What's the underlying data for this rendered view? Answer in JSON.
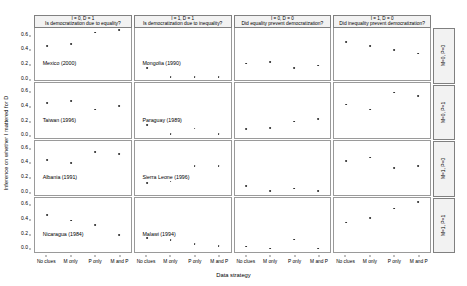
{
  "chart_data": {
    "type": "scatter",
    "title": "",
    "xlabel": "Data strategy",
    "ylabel": "Inference on whether I mattered for D",
    "categories": [
      "No clues",
      "M only",
      "P only",
      "M and P"
    ],
    "ylim": [
      -0.05,
      0.72
    ],
    "yticks": [
      0.0,
      0.2,
      0.4,
      0.6
    ],
    "ytick_labels": [
      "0.0",
      "0.2",
      "0.4",
      "0.6"
    ],
    "grid": false,
    "legend": "none",
    "col_strips": [
      {
        "condition": "I = 0, D = 1",
        "question": "Is democratization due to equality?"
      },
      {
        "condition": "I = 1, D = 1",
        "question": "Is democratization due to inequality?"
      },
      {
        "condition": "I = 0, D = 0",
        "question": "Did equality prevent democratization?"
      },
      {
        "condition": "I = 1, D = 0",
        "question": "Did inequality prevent democratization?"
      }
    ],
    "row_strips": [
      "M=0, P=0",
      "M=0, P=1",
      "M=1, P=0",
      "M=1, P=1"
    ],
    "panels": [
      {
        "row": 0,
        "col": 0,
        "label": "Mexico (2000)",
        "values": [
          0.44,
          0.47,
          0.63,
          0.66
        ]
      },
      {
        "row": 0,
        "col": 1,
        "label": "Mongolia (1990)",
        "values": [
          0.13,
          0.0,
          0.0,
          0.0
        ]
      },
      {
        "row": 0,
        "col": 2,
        "label": "",
        "values": [
          0.19,
          0.21,
          0.13,
          0.16
        ]
      },
      {
        "row": 0,
        "col": 3,
        "label": "",
        "values": [
          0.49,
          0.44,
          0.38,
          0.33
        ]
      },
      {
        "row": 1,
        "col": 0,
        "label": "Taiwan (1996)",
        "values": [
          0.44,
          0.47,
          0.35,
          0.4
        ]
      },
      {
        "row": 1,
        "col": 1,
        "label": "Paraguay (1989)",
        "values": [
          0.13,
          0.0,
          0.08,
          0.0
        ]
      },
      {
        "row": 1,
        "col": 2,
        "label": "",
        "values": [
          0.07,
          0.09,
          0.18,
          0.21
        ]
      },
      {
        "row": 1,
        "col": 3,
        "label": "",
        "values": [
          0.42,
          0.35,
          0.59,
          0.54
        ]
      },
      {
        "row": 2,
        "col": 0,
        "label": "Albania (1991)",
        "values": [
          0.44,
          0.4,
          0.56,
          0.53
        ]
      },
      {
        "row": 2,
        "col": 1,
        "label": "Sierra Leone (1996)",
        "values": [
          0.12,
          0.14,
          0.36,
          0.36
        ]
      },
      {
        "row": 2,
        "col": 2,
        "label": "",
        "values": [
          0.08,
          0.0,
          0.04,
          0.0
        ]
      },
      {
        "row": 2,
        "col": 3,
        "label": "",
        "values": [
          0.43,
          0.48,
          0.33,
          0.36
        ]
      },
      {
        "row": 3,
        "col": 0,
        "label": "Nicaragua (1984)",
        "values": [
          0.48,
          0.4,
          0.33,
          0.19
        ]
      },
      {
        "row": 3,
        "col": 1,
        "label": "Malawi (1994)",
        "values": [
          0.15,
          0.12,
          0.06,
          0.04
        ]
      },
      {
        "row": 3,
        "col": 2,
        "label": "",
        "values": [
          0.03,
          0.0,
          0.13,
          0.0
        ]
      },
      {
        "row": 3,
        "col": 3,
        "label": "",
        "values": [
          0.37,
          0.43,
          0.57,
          0.66
        ]
      }
    ]
  }
}
